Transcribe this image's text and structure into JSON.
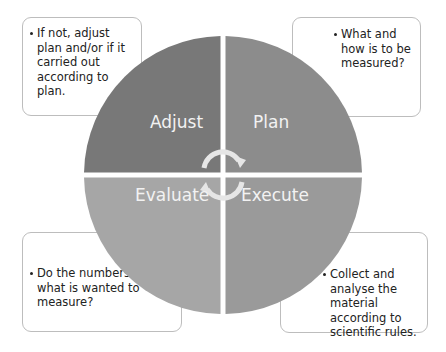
{
  "diagram": {
    "type": "cycle",
    "center_icon": "circular-arrows-icon",
    "colors": {
      "adjust": "#787878",
      "plan": "#8c8c8c",
      "evaluate": "#a6a6a6",
      "execute": "#9a9a9a",
      "arrows": "#e8e8e8",
      "note_border": "#bdbdbd"
    },
    "quadrants": [
      {
        "id": "adjust",
        "label": "Adjust",
        "position": "top-left"
      },
      {
        "id": "plan",
        "label": "Plan",
        "position": "top-right"
      },
      {
        "id": "evaluate",
        "label": "Evaluate",
        "position": "bottom-left"
      },
      {
        "id": "execute",
        "label": "Execute",
        "position": "bottom-right"
      }
    ],
    "notes": {
      "adjust": {
        "text": "If not, adjust plan and/or if it carried out according to plan."
      },
      "plan": {
        "text": "What and how is to be measured?"
      },
      "evaluate": {
        "text": "Do the numbers tell us what is wanted to measure?"
      },
      "execute": {
        "text": "Collect and analyse the material according to scientific rules."
      }
    }
  }
}
